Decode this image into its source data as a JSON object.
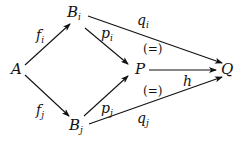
{
  "diagram": {
    "nodes": {
      "A": {
        "base": "A",
        "sub": ""
      },
      "Bi": {
        "base": "B",
        "sub": "i"
      },
      "Bj": {
        "base": "B",
        "sub": "j"
      },
      "P": {
        "base": "P",
        "sub": ""
      },
      "Q": {
        "base": "Q",
        "sub": ""
      }
    },
    "arrows": {
      "fi": {
        "base": "f",
        "sub": "i",
        "from": "A",
        "to": "B_i"
      },
      "fj": {
        "base": "f",
        "sub": "j",
        "from": "A",
        "to": "B_j"
      },
      "pi": {
        "base": "p",
        "sub": "i",
        "from": "B_i",
        "to": "P"
      },
      "pj": {
        "base": "p",
        "sub": "j",
        "from": "B_j",
        "to": "P"
      },
      "qi": {
        "base": "q",
        "sub": "i",
        "from": "B_i",
        "to": "Q"
      },
      "qj": {
        "base": "q",
        "sub": "j",
        "from": "B_j",
        "to": "Q"
      },
      "h": {
        "base": "h",
        "sub": "",
        "from": "P",
        "to": "Q"
      }
    },
    "commutativity": {
      "upper": "(=)",
      "lower": "(=)"
    }
  }
}
